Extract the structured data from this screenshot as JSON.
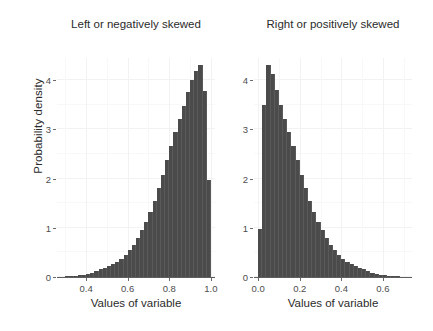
{
  "figure": {
    "ylabel": "Probability density",
    "background_color": "#ffffff",
    "bar_color": "#4b4b4b",
    "grid_color": "#f2f2f2",
    "axis_color": "#5e5e5e",
    "text_color": "#2b2b2b"
  },
  "chart_data": [
    {
      "type": "bar",
      "panel": "left",
      "title": "Left or negatively skewed",
      "xlabel": "Values of variable",
      "ylabel": "Probability density",
      "xlim": [
        0.26,
        1.02
      ],
      "ylim": [
        0,
        4.45
      ],
      "xticks": [
        0.4,
        0.6,
        0.8,
        1.0
      ],
      "xtick_labels": [
        "0.4",
        "0.6",
        "0.8",
        "1.0"
      ],
      "yticks": [
        0,
        1,
        2,
        3,
        4
      ],
      "ytick_labels": [
        "0",
        "1",
        "2",
        "3",
        "4"
      ],
      "grid": true,
      "legend": "none",
      "bin_width": 0.02,
      "bin_starts": [
        0.26,
        0.28,
        0.3,
        0.32,
        0.34,
        0.36,
        0.38,
        0.4,
        0.42,
        0.44,
        0.46,
        0.48,
        0.5,
        0.52,
        0.54,
        0.56,
        0.58,
        0.6,
        0.62,
        0.64,
        0.66,
        0.68,
        0.7,
        0.72,
        0.74,
        0.76,
        0.78,
        0.8,
        0.82,
        0.84,
        0.86,
        0.88,
        0.9,
        0.92,
        0.94,
        0.96,
        0.98
      ],
      "values": [
        0.01,
        0.01,
        0.02,
        0.02,
        0.03,
        0.04,
        0.05,
        0.07,
        0.09,
        0.12,
        0.16,
        0.19,
        0.22,
        0.27,
        0.31,
        0.37,
        0.45,
        0.55,
        0.66,
        0.79,
        0.95,
        1.12,
        1.32,
        1.55,
        1.8,
        2.07,
        2.37,
        2.66,
        2.95,
        3.22,
        3.48,
        3.75,
        4.0,
        4.18,
        4.3,
        3.78,
        1.97
      ]
    },
    {
      "type": "bar",
      "panel": "right",
      "title": "Right or positively skewed",
      "xlabel": "Values of variable",
      "ylabel": "Probability density",
      "xlim": [
        -0.02,
        0.74
      ],
      "ylim": [
        0,
        4.45
      ],
      "xticks": [
        0.0,
        0.2,
        0.4,
        0.6
      ],
      "xtick_labels": [
        "0.0",
        "0.2",
        "0.4",
        "0.6"
      ],
      "yticks": [
        0,
        1,
        2,
        3,
        4
      ],
      "ytick_labels": [
        "0",
        "1",
        "2",
        "3",
        "4"
      ],
      "grid": true,
      "legend": "none",
      "bin_width": 0.02,
      "bin_starts": [
        0.0,
        0.02,
        0.04,
        0.06,
        0.08,
        0.1,
        0.12,
        0.14,
        0.16,
        0.18,
        0.2,
        0.22,
        0.24,
        0.26,
        0.28,
        0.3,
        0.32,
        0.34,
        0.36,
        0.38,
        0.4,
        0.42,
        0.44,
        0.46,
        0.48,
        0.5,
        0.52,
        0.54,
        0.56,
        0.58,
        0.6,
        0.62,
        0.64,
        0.66,
        0.68,
        0.7,
        0.72
      ],
      "values": [
        0.97,
        3.5,
        4.3,
        4.12,
        3.8,
        3.5,
        3.22,
        2.95,
        2.66,
        2.37,
        2.07,
        1.8,
        1.55,
        1.32,
        1.12,
        0.95,
        0.79,
        0.66,
        0.55,
        0.45,
        0.37,
        0.31,
        0.27,
        0.22,
        0.19,
        0.16,
        0.12,
        0.09,
        0.07,
        0.05,
        0.04,
        0.03,
        0.02,
        0.02,
        0.01,
        0.01,
        0.01
      ]
    }
  ]
}
